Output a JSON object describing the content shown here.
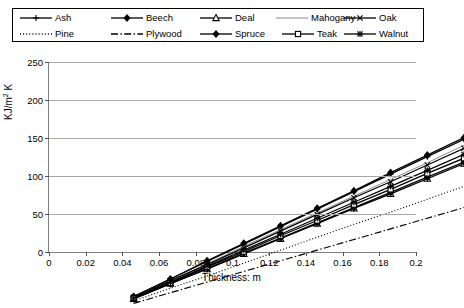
{
  "chart_data": {
    "type": "line",
    "title": "",
    "xlabel": "Thickness: m",
    "ylabel": "KJ/m2 K",
    "ylabel_base": "KJ/m",
    "ylabel_sup": "2",
    "ylabel_tail": " K",
    "xlim": [
      0,
      0.2
    ],
    "ylim": [
      0,
      250
    ],
    "grid": true,
    "legend_position": "top",
    "x": [
      0.02,
      0.04,
      0.06,
      0.08,
      0.1,
      0.12,
      0.14,
      0.16,
      0.18,
      0.2
    ],
    "xticks": [
      "0",
      "0.02",
      "0.04",
      "0.06",
      "0.08",
      "0.1",
      "0.12",
      "0.14",
      "0.16",
      "0.18",
      "0.2"
    ],
    "xtick_values": [
      0,
      0.02,
      0.04,
      0.06,
      0.08,
      0.1,
      0.12,
      0.14,
      0.16,
      0.18,
      0.2
    ],
    "yticks": [
      "0",
      "50",
      "100",
      "150",
      "200",
      "250"
    ],
    "ytick_values": [
      0,
      50,
      100,
      150,
      200,
      250
    ],
    "series": [
      {
        "name": "Ash",
        "marker": "plus",
        "dash": "solid",
        "values": [
          23,
          46,
          69,
          92,
          115,
          138,
          161,
          184,
          207,
          230
        ]
      },
      {
        "name": "Beech",
        "marker": "diamond",
        "dash": "solid",
        "values": [
          23,
          46,
          70,
          93,
          116,
          139,
          162,
          186,
          209,
          232
        ]
      },
      {
        "name": "Deal",
        "marker": "triangle",
        "dash": "solid",
        "values": [
          20,
          40,
          59,
          79,
          99,
          119,
          139,
          158,
          178,
          198
        ]
      },
      {
        "name": "Mahogany",
        "marker": "none",
        "dash": "solid",
        "values": [
          22,
          44,
          66,
          89,
          111,
          133,
          155,
          177,
          199,
          222
        ]
      },
      {
        "name": "Oak",
        "marker": "cross",
        "dash": "solid",
        "values": [
          22,
          44,
          65,
          87,
          109,
          131,
          153,
          174,
          196,
          218
        ]
      },
      {
        "name": "Pine",
        "marker": "none",
        "dash": "dotted",
        "values": [
          17,
          34,
          50,
          67,
          84,
          101,
          118,
          134,
          151,
          168
        ]
      },
      {
        "name": "Plywood",
        "marker": "none",
        "dash": "dashdot",
        "values": [
          14,
          28,
          42,
          56,
          70,
          84,
          98,
          112,
          126,
          140
        ]
      },
      {
        "name": "Spruce",
        "marker": "diamond",
        "dash": "solid",
        "values": [
          20,
          40,
          60,
          80,
          100,
          120,
          140,
          160,
          180,
          200
        ]
      },
      {
        "name": "Teak",
        "marker": "square",
        "dash": "solid",
        "values": [
          21,
          41,
          62,
          82,
          103,
          123,
          144,
          164,
          185,
          205
        ]
      },
      {
        "name": "Walnut",
        "marker": "star",
        "dash": "solid",
        "values": [
          21,
          42,
          63,
          84,
          105,
          126,
          147,
          168,
          189,
          210
        ]
      }
    ]
  },
  "legend": {
    "rows": [
      [
        {
          "label": "Ash",
          "marker": "plus",
          "dash": "solid"
        },
        {
          "label": "Beech",
          "marker": "diamond",
          "dash": "solid"
        },
        {
          "label": "Deal",
          "marker": "triangle",
          "dash": "solid"
        },
        {
          "label": "Mahogany",
          "marker": "none",
          "dash": "solid"
        },
        {
          "label": "Oak",
          "marker": "cross",
          "dash": "solid"
        }
      ],
      [
        {
          "label": "Pine",
          "marker": "none",
          "dash": "dotted"
        },
        {
          "label": "Plywood",
          "marker": "none",
          "dash": "dashdot"
        },
        {
          "label": "Spruce",
          "marker": "diamond",
          "dash": "solid"
        },
        {
          "label": "Teak",
          "marker": "square",
          "dash": "solid"
        },
        {
          "label": "Walnut",
          "marker": "star",
          "dash": "solid"
        }
      ]
    ],
    "row_positions": [
      [
        6,
        97,
        186,
        262,
        330
      ],
      [
        6,
        97,
        186,
        268,
        330
      ]
    ]
  },
  "colors": {
    "series": "#000000",
    "grid": "#a8a8a8",
    "axis": "#7f7f7f",
    "mahogany": "#8c8c8c",
    "background": "#ffffff"
  }
}
